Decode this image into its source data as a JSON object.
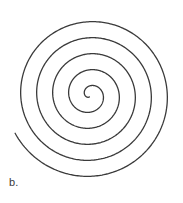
{
  "figure": {
    "label": "b.",
    "caption_position": "bottom-left",
    "background_color": "#ffffff",
    "stroke_color": "#3a3a3a",
    "stroke_width": 1.3,
    "width": 183,
    "height": 203
  },
  "chart_data": {
    "type": "line",
    "title": "",
    "subtitle": "",
    "xlabel": "",
    "ylabel": "",
    "annotations": [
      "b."
    ],
    "legend": [],
    "grid": false,
    "curve": {
      "name": "archimedean-spiral",
      "equation": "r = a + b*theta",
      "a": 2.0,
      "b": 2.55,
      "theta_start": 0.0,
      "theta_end": 32.2,
      "turns": 5.1,
      "center_x": 90,
      "center_y": 95,
      "rotation_deg": 108,
      "inner_end_x": 88,
      "inner_end_y": 98,
      "outer_end_x": 108,
      "outer_end_y": 188,
      "bbox": [
        12,
        10,
        172,
        175
      ],
      "arm_spacing_px": 16,
      "left_crossings_x": [
        12,
        28,
        44,
        60,
        74
      ],
      "right_crossings_x": [
        103,
        118,
        133,
        149,
        164
      ],
      "scan_y": 95
    },
    "x": [],
    "values": [],
    "xlim": [
      0,
      183
    ],
    "ylim": [
      0,
      203
    ]
  }
}
